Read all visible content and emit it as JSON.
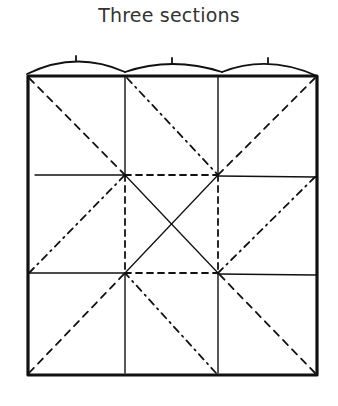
{
  "title": "Three sections",
  "colors": {
    "ink": "#111111",
    "title": "#333333",
    "background": "#ffffff"
  },
  "diagram": {
    "type": "folding-pattern",
    "outer_square": {
      "x1": 27,
      "y1": 74,
      "x2": 317,
      "y2": 375
    },
    "sections_per_side": 3,
    "top_arcs": [
      {
        "from_x": 27,
        "to_x": 125,
        "tick_x": 76
      },
      {
        "from_x": 125,
        "to_x": 222,
        "tick_x": 172
      },
      {
        "from_x": 222,
        "to_x": 317,
        "tick_x": 268
      }
    ],
    "line_styles": [
      "solid-thick border",
      "solid thin grid",
      "dashed",
      "dash-dot"
    ]
  }
}
